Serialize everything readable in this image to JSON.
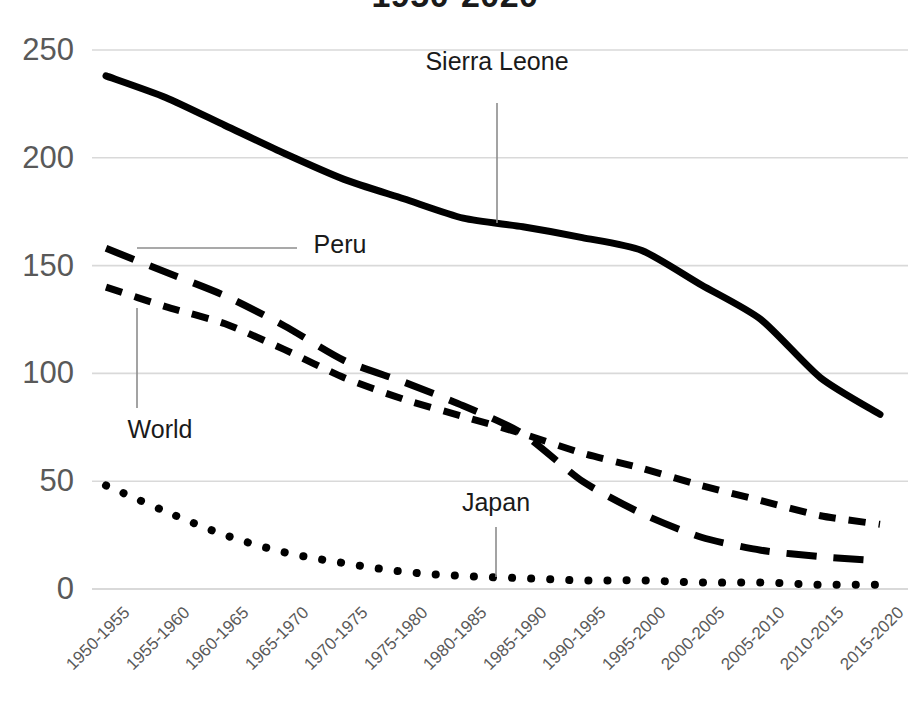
{
  "chart_data": {
    "type": "line",
    "title": "1950-2020",
    "xlabel": "",
    "ylabel": "",
    "ylim": [
      0,
      250
    ],
    "yticks": [
      0,
      50,
      100,
      150,
      200,
      250
    ],
    "grid": true,
    "legend_position": "inline-labels",
    "categories": [
      "1950-1955",
      "1955-1960",
      "1960-1965",
      "1965-1970",
      "1970-1975",
      "1975-1980",
      "1980-1985",
      "1985-1990",
      "1990-1995",
      "1995-2000",
      "2000-2005",
      "2005-2010",
      "2010-2015",
      "2015-2020"
    ],
    "series": [
      {
        "name": "Sierra Leone",
        "style": "solid",
        "values": [
          238,
          228,
          215,
          202,
          190,
          181,
          172,
          168,
          163,
          157,
          141,
          125,
          98,
          81
        ]
      },
      {
        "name": "Peru",
        "style": "long-dash",
        "values": [
          158,
          147,
          136,
          122,
          106,
          96,
          85,
          72,
          50,
          35,
          24,
          18,
          15,
          13
        ]
      },
      {
        "name": "World",
        "style": "short-dash",
        "values": [
          140,
          131,
          123,
          111,
          98,
          88,
          80,
          72,
          63,
          56,
          48,
          41,
          34,
          30
        ]
      },
      {
        "name": "Japan",
        "style": "dotted",
        "values": [
          48,
          36,
          25,
          17,
          12,
          8,
          6,
          5,
          4,
          4,
          3,
          3,
          2,
          2
        ]
      }
    ],
    "annotations": [
      {
        "text": "Sierra Leone",
        "leader": "vertical"
      },
      {
        "text": "Peru",
        "leader": "horizontal"
      },
      {
        "text": "World",
        "leader": "vertical"
      },
      {
        "text": "Japan",
        "leader": "vertical"
      }
    ],
    "colors": {
      "line": "#000000",
      "grid": "#d9d9d9",
      "tick_text": "#595959",
      "label_text": "#1a1a1a",
      "background": "#ffffff"
    }
  }
}
